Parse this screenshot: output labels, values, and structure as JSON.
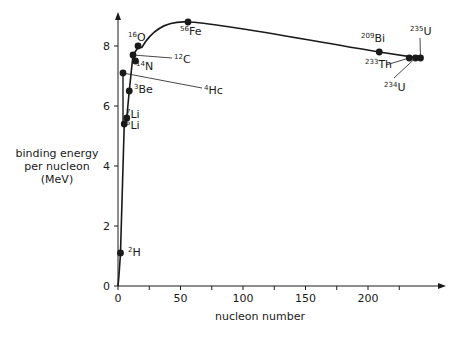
{
  "chart_data": {
    "type": "line",
    "title": "",
    "xlabel": "nucleon number",
    "ylabel": "binding energy per nucleon (MeV)",
    "ylabel_lines": [
      "binding energy",
      "per nucleon",
      "(MeV)"
    ],
    "xlim": [
      0,
      250
    ],
    "ylim": [
      0,
      9
    ],
    "x_ticks": [
      0,
      50,
      100,
      150,
      200
    ],
    "y_ticks": [
      0,
      2,
      4,
      6,
      8
    ],
    "grid": false,
    "legend": null,
    "series": [
      {
        "name": "binding energy per nucleon",
        "points": [
          {
            "nuclide": "2H",
            "mass": 2,
            "element": "H",
            "A": 2,
            "x": 2,
            "y": 1.1
          },
          {
            "nuclide": "5Li",
            "mass": 5,
            "element": "Li",
            "A": 5,
            "x": 5,
            "y": 5.4
          },
          {
            "nuclide": "7Li",
            "mass": 7,
            "element": "Li",
            "A": 7,
            "x": 7,
            "y": 5.6
          },
          {
            "nuclide": "3Be",
            "mass": 3,
            "element": "Be",
            "A": 9,
            "x": 9,
            "y": 6.5
          },
          {
            "nuclide": "4He",
            "mass": 4,
            "element": "Hc",
            "A": 4,
            "x": 4,
            "y": 7.1
          },
          {
            "nuclide": "14N",
            "mass": 14,
            "element": "N",
            "A": 14,
            "x": 14,
            "y": 7.5
          },
          {
            "nuclide": "12C",
            "mass": 12,
            "element": "C",
            "A": 12,
            "x": 12,
            "y": 7.7
          },
          {
            "nuclide": "16O",
            "mass": 16,
            "element": "O",
            "A": 16,
            "x": 16,
            "y": 8.0
          },
          {
            "nuclide": "56Fe",
            "mass": 56,
            "element": "Fe",
            "A": 56,
            "x": 56,
            "y": 8.8
          },
          {
            "nuclide": "209Bi",
            "mass": 209,
            "element": "Bi",
            "A": 209,
            "x": 209,
            "y": 7.8
          },
          {
            "nuclide": "233Th",
            "mass": 233,
            "element": "Th",
            "A": 233,
            "x": 233,
            "y": 7.6
          },
          {
            "nuclide": "234U",
            "mass": 234,
            "element": "U",
            "A": 238,
            "x": 238,
            "y": 7.6
          },
          {
            "nuclide": "235U",
            "mass": 235,
            "element": "U",
            "A": 242,
            "x": 242,
            "y": 7.6
          }
        ]
      }
    ],
    "annotations": [
      "2H",
      "5Li",
      "7Li",
      "3Be",
      "4Hc",
      "14N",
      "12C",
      "16O",
      "56Fe",
      "209Bi",
      "233Th",
      "234U",
      "235U"
    ]
  }
}
